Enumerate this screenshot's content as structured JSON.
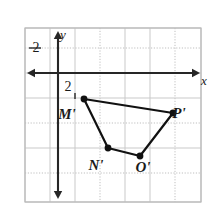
{
  "figure": {
    "background_color": "#ffffff",
    "grid": {
      "border_color": "#b9b9b9",
      "line_color": "#c9c9c9",
      "dotted_line_color": "#bfbfbf",
      "x_left": 25,
      "x_right": 201,
      "y_top": 28,
      "y_bottom": 202,
      "cell_size": 25,
      "vertical_lines": [
        25,
        50,
        75,
        100,
        125,
        150,
        175,
        201
      ],
      "horizontal_lines": [
        28,
        48,
        73,
        98,
        123,
        148,
        173,
        202
      ],
      "dotted_rows": [
        48,
        123,
        173
      ],
      "dotted_cols": [
        100,
        175
      ]
    },
    "axes": {
      "color": "#262626",
      "x_axis": {
        "label": "x",
        "y_pixel": 73,
        "x_start": 27,
        "x_end": 200,
        "label_x": 204,
        "label_y": 85,
        "arrows": "both"
      },
      "y_axis": {
        "label": "y",
        "x_pixel": 58,
        "y_start": 31,
        "y_end": 199,
        "label_x": 63,
        "label_y": 39,
        "arrows": "both"
      }
    },
    "ticks": [
      {
        "name": "y-tick-2",
        "text": "2",
        "x": 36,
        "y": 52,
        "mark_x1": 29,
        "mark_x2": 41,
        "mark_y": 48
      },
      {
        "name": "x-tick-2",
        "text": "2",
        "x": 68,
        "y": 91,
        "mark_x": 75,
        "mark_y1": 93,
        "mark_y2": 99
      }
    ]
  },
  "chart_data": {
    "type": "scatter",
    "title": "",
    "xlabel": "x",
    "ylabel": "y",
    "grid": true,
    "legend_position": "none",
    "shape_name": "M'N'O'P'",
    "points": [
      {
        "label": "M'",
        "x_px": 84,
        "y_px": 99,
        "label_x": 67,
        "label_y": 119
      },
      {
        "label": "N'",
        "x_px": 108,
        "y_px": 148,
        "label_x": 96,
        "label_y": 170
      },
      {
        "label": "O'",
        "x_px": 140,
        "y_px": 156,
        "label_x": 143,
        "label_y": 172
      },
      {
        "label": "P'",
        "x_px": 173,
        "y_px": 113,
        "label_x": 179,
        "label_y": 118
      }
    ],
    "edges": [
      [
        "M'",
        "P'"
      ],
      [
        "M'",
        "N'"
      ],
      [
        "N'",
        "O'"
      ],
      [
        "O'",
        "P'"
      ]
    ],
    "point_color": "#111111",
    "edge_color": "#111111",
    "edge_width": 2.2,
    "point_radius": 3.4
  }
}
